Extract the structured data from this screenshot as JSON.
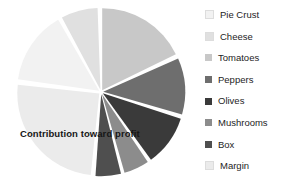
{
  "chart_data": {
    "type": "pie",
    "title": "Contribution toward profit",
    "xlabel": "",
    "ylabel": "",
    "grid": false,
    "legend_position": "right",
    "exploded": true,
    "start_angle_deg": 0,
    "direction": "clockwise",
    "categories": [
      "Pie Crust",
      "Cheese",
      "Tomatoes",
      "Peppers",
      "Olives",
      "Mushrooms",
      "Box",
      "Margin"
    ],
    "values": [
      15,
      10,
      18,
      11,
      10,
      5,
      5,
      26
    ],
    "colors": [
      "#f2f2f2",
      "#e0e0e0",
      "#c8c8c8",
      "#6e6e6e",
      "#3a3a3a",
      "#8c8c8c",
      "#4f4f4f",
      "#ebebeb"
    ],
    "slices": [
      {
        "label": "Tomatoes",
        "value": 18,
        "color": "#c8c8c8",
        "start_deg": 0,
        "end_deg": 64
      },
      {
        "label": "Peppers",
        "value": 11,
        "color": "#6e6e6e",
        "start_deg": 66,
        "end_deg": 106
      },
      {
        "label": "Olives",
        "value": 10,
        "color": "#3a3a3a",
        "start_deg": 108,
        "end_deg": 144
      },
      {
        "label": "Mushrooms",
        "value": 5,
        "color": "#8c8c8c",
        "start_deg": 146,
        "end_deg": 164
      },
      {
        "label": "Box",
        "value": 5,
        "color": "#4f4f4f",
        "start_deg": 166,
        "end_deg": 184
      },
      {
        "label": "Margin",
        "value": 26,
        "color": "#ebebeb",
        "start_deg": 186,
        "end_deg": 276
      },
      {
        "label": "Pie Crust",
        "value": 15,
        "color": "#f2f2f2",
        "start_deg": 278,
        "end_deg": 330
      },
      {
        "label": "Cheese",
        "value": 10,
        "color": "#e0e0e0",
        "start_deg": 332,
        "end_deg": 358
      }
    ]
  },
  "legend": {
    "items": [
      {
        "label": "Pie Crust",
        "color": "#f2f2f2"
      },
      {
        "label": "Cheese",
        "color": "#e0e0e0"
      },
      {
        "label": "Tomatoes",
        "color": "#c8c8c8"
      },
      {
        "label": "Peppers",
        "color": "#6e6e6e"
      },
      {
        "label": "Olives",
        "color": "#3a3a3a"
      },
      {
        "label": "Mushrooms",
        "color": "#8c8c8c"
      },
      {
        "label": "Box",
        "color": "#4f4f4f"
      },
      {
        "label": "Margin",
        "color": "#ebebeb"
      }
    ]
  }
}
